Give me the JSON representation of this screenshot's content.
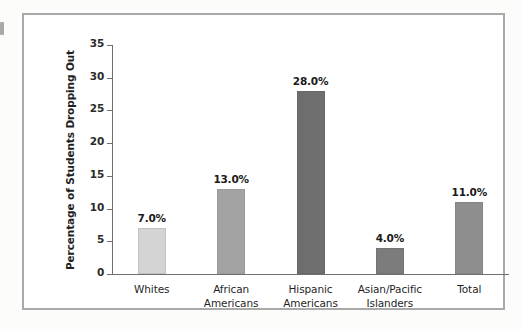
{
  "figure": {
    "frame_color": "#a9a9a9",
    "background": "#ffffff"
  },
  "chart_data": {
    "type": "bar",
    "title": "",
    "subtitle": "",
    "xlabel": "",
    "ylabel": "Percentage of Students Dropping Out",
    "ylim": [
      0,
      35
    ],
    "ytick_step": 5,
    "yticks": [
      "0",
      "5",
      "10",
      "15",
      "20",
      "25",
      "30",
      "35"
    ],
    "grid": false,
    "legend": false,
    "categories": [
      "Whites",
      "African Americans",
      "Hispanic Americans",
      "Asian/Pacific Islanders",
      "Total"
    ],
    "category_lines": [
      [
        "Whites"
      ],
      [
        "African",
        "Americans"
      ],
      [
        "Hispanic",
        "Americans"
      ],
      [
        "Asian/Pacific",
        "Islanders"
      ],
      [
        "Total"
      ]
    ],
    "values": [
      7.0,
      13.0,
      28.0,
      4.0,
      11.0
    ],
    "value_labels": [
      "7.0%",
      "13.0%",
      "28.0%",
      "4.0%",
      "11.0%"
    ],
    "bar_colors": [
      "#d4d4d4",
      "#a3a3a3",
      "#6e6e6e",
      "#7c7c7c",
      "#8e8e8e"
    ],
    "bar_edge_colors": [
      "#c2c2c2",
      "#9a9a9a",
      "#686868",
      "#747474",
      "#868686"
    ]
  }
}
